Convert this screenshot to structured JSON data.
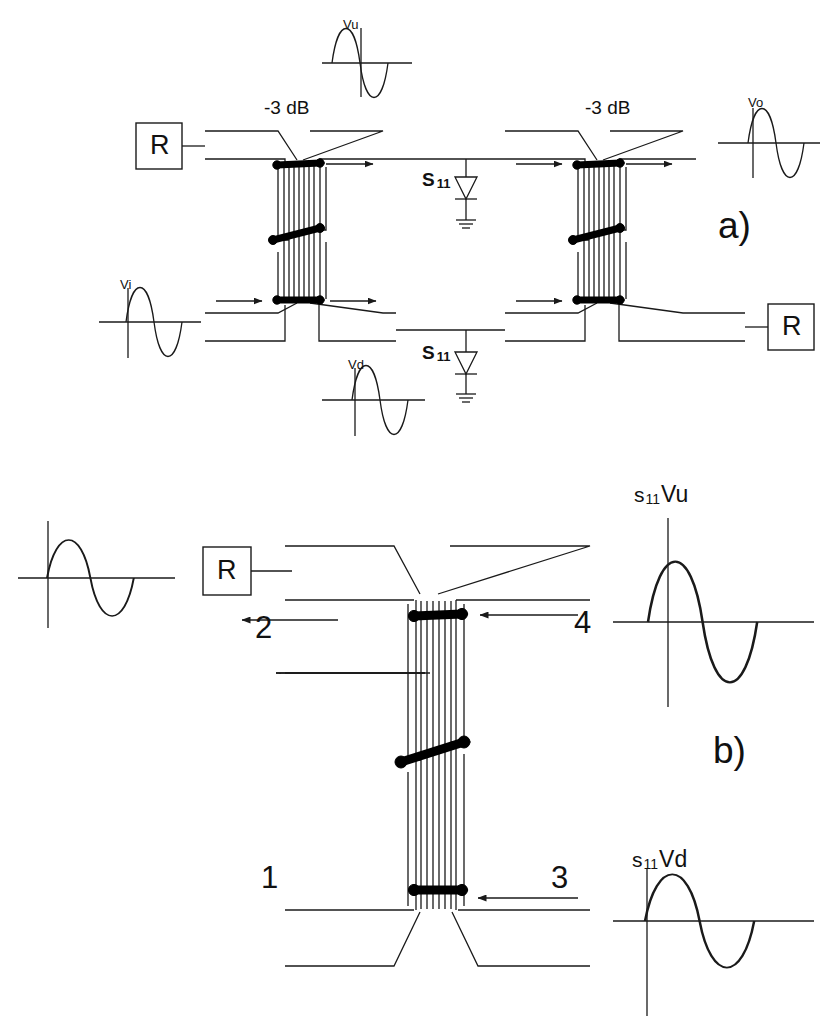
{
  "figure": {
    "panels": [
      {
        "id": "a",
        "label": "a)"
      },
      {
        "id": "b",
        "label": "b)"
      }
    ]
  },
  "panel_a": {
    "label": "a)",
    "coupler_left": {
      "db_label": "-3 dB",
      "terminator_label": "R"
    },
    "coupler_right": {
      "db_label": "-3 dB",
      "terminator_label": "R"
    },
    "diode_top": {
      "label": "S",
      "subscript": "11"
    },
    "diode_bottom": {
      "label": "S",
      "subscript": "11"
    },
    "waveforms": [
      {
        "name": "Vu",
        "label": "Vu",
        "phase": "positive-first",
        "has_axis": true
      },
      {
        "name": "Vo",
        "label": "Vo",
        "phase": "positive-first",
        "has_axis": true
      },
      {
        "name": "Vi",
        "label": "Vi",
        "phase": "positive-first",
        "has_axis": true
      },
      {
        "name": "Vd",
        "label": "Vd",
        "phase": "positive-first",
        "has_axis": true
      }
    ]
  },
  "panel_b": {
    "label": "b)",
    "terminator_label": "R",
    "ports": [
      {
        "number": "1",
        "arrow": "none"
      },
      {
        "number": "2",
        "arrow": "left"
      },
      {
        "number": "3",
        "arrow": "left"
      },
      {
        "number": "4",
        "arrow": "left"
      }
    ],
    "waveforms": [
      {
        "name": "input-unlabeled",
        "label": "",
        "phase": "positive-first",
        "has_axis": true
      },
      {
        "name": "s11Vu",
        "prefix": "s",
        "subscript": "11",
        "variable": "Vu",
        "phase": "positive-first",
        "has_axis": true
      },
      {
        "name": "s11Vd",
        "prefix": "s",
        "subscript": "11",
        "variable": "Vd",
        "phase": "positive-first",
        "has_axis": true
      }
    ]
  },
  "colors": {
    "line": "#1a1a1a",
    "bond_wire": "#000000",
    "background": "#ffffff"
  }
}
